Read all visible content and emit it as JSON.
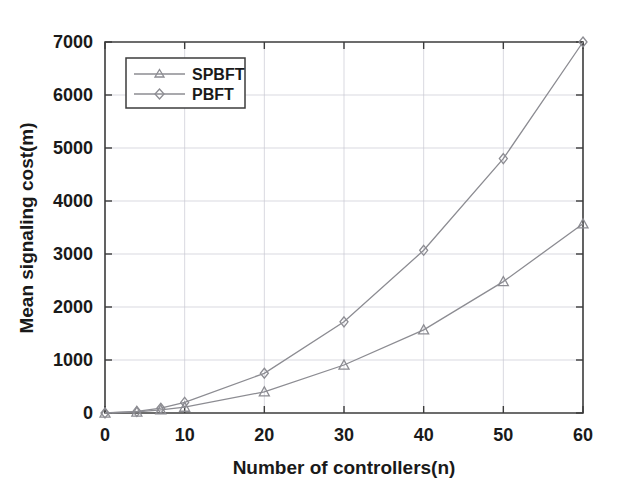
{
  "chart_data": {
    "type": "line",
    "title": "",
    "xlabel": "Number of controllers(n)",
    "ylabel": "Mean signaling cost(m)",
    "xlim": [
      0,
      60
    ],
    "ylim": [
      0,
      7000
    ],
    "xticks": [
      0,
      10,
      20,
      30,
      40,
      50,
      60
    ],
    "yticks": [
      0,
      1000,
      2000,
      3000,
      4000,
      5000,
      6000,
      7000
    ],
    "xtick_labels": [
      "0",
      "10",
      "20",
      "30",
      "40",
      "50",
      "60"
    ],
    "ytick_labels": [
      "0",
      "1000",
      "2000",
      "3000",
      "4000",
      "5000",
      "6000",
      "7000"
    ],
    "grid": true,
    "legend_position": "upper left",
    "x": [
      0,
      4,
      7,
      10,
      20,
      30,
      40,
      50,
      60
    ],
    "series": [
      {
        "name": "SPBFT",
        "marker": "triangle",
        "values": [
          0,
          20,
          60,
          110,
          400,
          905,
          1570,
          2480,
          3570
        ]
      },
      {
        "name": "PBFT",
        "marker": "diamond",
        "values": [
          0,
          30,
          90,
          200,
          750,
          1720,
          3070,
          4800,
          7000
        ]
      }
    ]
  },
  "legend": {
    "entries": [
      {
        "label": "SPBFT"
      },
      {
        "label": "PBFT"
      }
    ]
  },
  "colors": {
    "line": "#8c8c92",
    "axis": "#3c3c3c",
    "grid": "#c8c8d2",
    "text": "#1a1a1a",
    "background": "#ffffff"
  }
}
